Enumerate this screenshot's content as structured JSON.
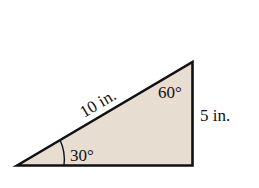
{
  "diagram": {
    "type": "right-triangle",
    "fill_color": "#e8ddd1",
    "stroke_color": "#111111",
    "labels": {
      "hypotenuse": "10 in.",
      "vertical_side": "5 in.",
      "angle_bottom_left": "30°",
      "angle_top": "60°"
    }
  }
}
